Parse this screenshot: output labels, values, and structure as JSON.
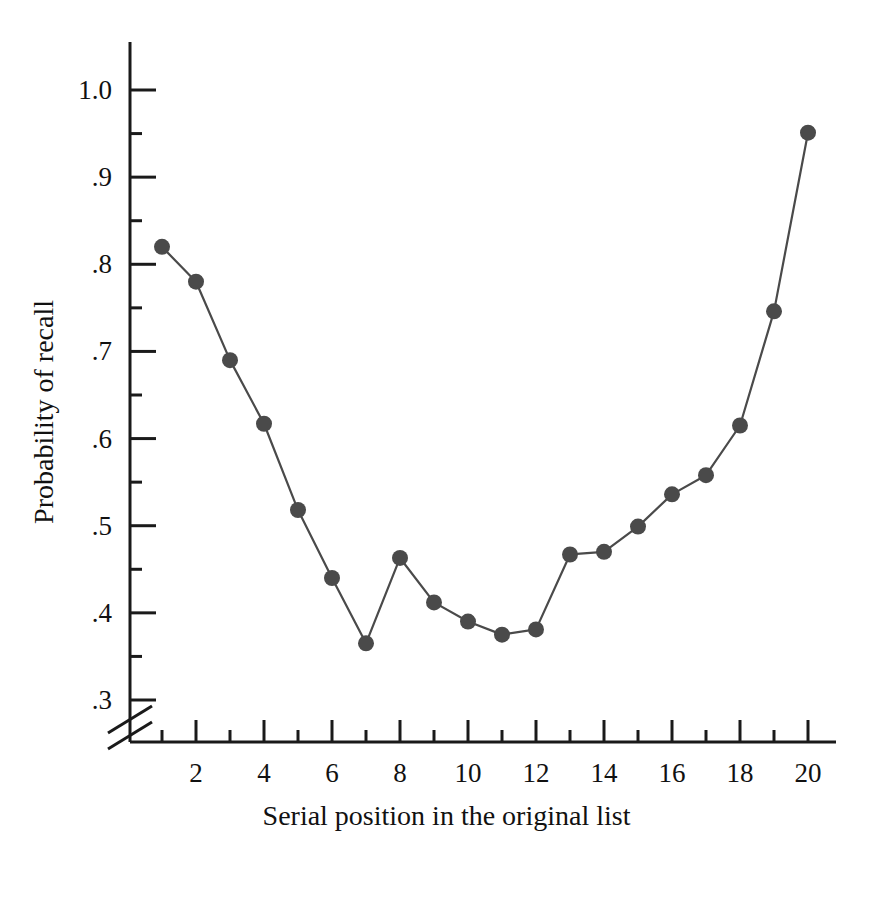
{
  "chart_data": {
    "type": "line",
    "title": "",
    "subtitle": "",
    "xlabel": "Serial position in the original list",
    "ylabel": "Probability of recall",
    "x": [
      1,
      2,
      3,
      4,
      5,
      6,
      7,
      8,
      9,
      10,
      11,
      12,
      13,
      14,
      15,
      16,
      17,
      18,
      19,
      20
    ],
    "values": [
      0.82,
      0.78,
      0.69,
      0.617,
      0.518,
      0.44,
      0.365,
      0.463,
      0.412,
      0.39,
      0.375,
      0.381,
      0.467,
      0.47,
      0.499,
      0.536,
      0.558,
      0.615,
      0.746,
      0.951
    ],
    "series": [
      {
        "name": "Probability of recall",
        "values": [
          0.82,
          0.78,
          0.69,
          0.617,
          0.518,
          0.44,
          0.365,
          0.463,
          0.412,
          0.39,
          0.375,
          0.381,
          0.467,
          0.47,
          0.499,
          0.536,
          0.558,
          0.615,
          0.746,
          0.951
        ]
      }
    ],
    "xlim": [
      0,
      21
    ],
    "ylim": [
      0.3,
      1.05
    ],
    "x_tick_labels": [
      "2",
      "4",
      "6",
      "8",
      "10",
      "12",
      "14",
      "16",
      "18",
      "20"
    ],
    "x_tick_values": [
      2,
      4,
      6,
      8,
      10,
      12,
      14,
      16,
      18,
      20
    ],
    "x_minor_tick_values": [
      1,
      3,
      5,
      7,
      9,
      11,
      13,
      15,
      17,
      19
    ],
    "y_tick_labels": [
      "1.0",
      ".9",
      ".8",
      ".7",
      ".6",
      ".5",
      ".4",
      ".3"
    ],
    "y_tick_values": [
      1.0,
      0.9,
      0.8,
      0.7,
      0.6,
      0.5,
      0.4,
      0.3
    ],
    "y_minor_tick_values": [
      0.95,
      0.85,
      0.75,
      0.65,
      0.55,
      0.45,
      0.35
    ],
    "grid": false,
    "legend": false,
    "legend_position": "none",
    "axis_break": {
      "axis": "y",
      "below": 0.3,
      "style": "double-slash"
    },
    "marker_color": "#4a4a4a",
    "line_color": "#4a4a4a",
    "axis_color": "#1a1a1a",
    "background_color": "#ffffff",
    "marker_shape": "circle",
    "marker_size": 16
  }
}
